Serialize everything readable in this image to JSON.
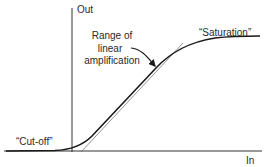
{
  "diagram": {
    "type": "amplifier transfer characteristic",
    "axes": {
      "y_label": "Out",
      "x_label": "In"
    },
    "annotations": {
      "range_line1": "Range of",
      "range_line2": "linear",
      "range_line3": "amplification",
      "saturation": "“Saturation”",
      "cutoff": "“Cut-off”"
    },
    "colors": {
      "curve": "#1a1a1a",
      "axis": "#333333",
      "tangent": "#555555",
      "text": "#2a2a2a"
    }
  }
}
